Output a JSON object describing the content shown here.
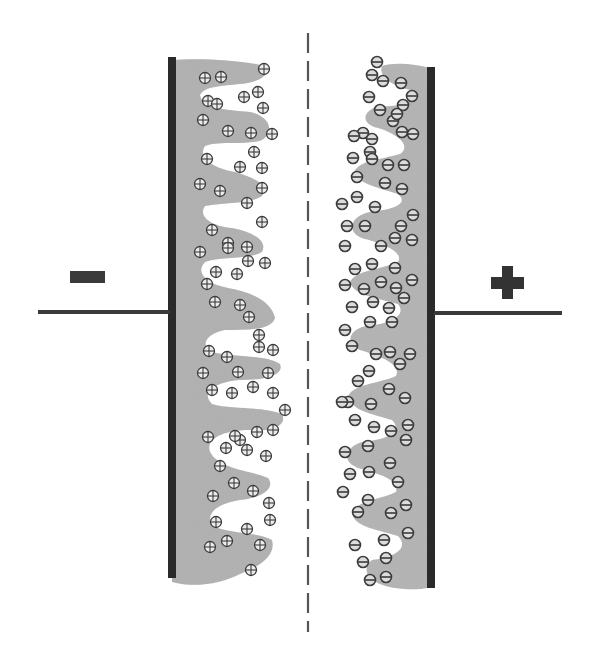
{
  "diagram": {
    "title": "Electric double-layer capacitor",
    "colors": {
      "background": "#ffffff",
      "electrode_plate": "#2a2a2a",
      "porous_material": "#a9a9a9",
      "porous_material_dark": "#8c8c8c",
      "wire": "#3a3a3a",
      "ion_stroke": "#3c3c3c",
      "ion_fill": "#e6e6e6",
      "separator": "#555555"
    },
    "negative_terminal": {
      "symbol": "−",
      "label": "negative-electrode"
    },
    "positive_terminal": {
      "symbol": "+",
      "label": "positive-electrode"
    },
    "separator": {
      "style": "dashed",
      "label": "separator"
    },
    "left_ions": {
      "type": "cation",
      "glyph": "⊕",
      "positions": [
        [
          205,
          78
        ],
        [
          221,
          77
        ],
        [
          264,
          69
        ],
        [
          258,
          92
        ],
        [
          208,
          101
        ],
        [
          217,
          104
        ],
        [
          244,
          97
        ],
        [
          263,
          108
        ],
        [
          203,
          120
        ],
        [
          228,
          131
        ],
        [
          251,
          133
        ],
        [
          272,
          134
        ],
        [
          254,
          152
        ],
        [
          207,
          159
        ],
        [
          240,
          167
        ],
        [
          262,
          168
        ],
        [
          200,
          184
        ],
        [
          220,
          191
        ],
        [
          262,
          188
        ],
        [
          247,
          203
        ],
        [
          262,
          222
        ],
        [
          212,
          230
        ],
        [
          228,
          243
        ],
        [
          247,
          247
        ],
        [
          200,
          252
        ],
        [
          228,
          248
        ],
        [
          248,
          261
        ],
        [
          265,
          263
        ],
        [
          216,
          272
        ],
        [
          237,
          274
        ],
        [
          207,
          284
        ],
        [
          215,
          302
        ],
        [
          240,
          305
        ],
        [
          249,
          317
        ],
        [
          259,
          335
        ],
        [
          209,
          351
        ],
        [
          227,
          357
        ],
        [
          259,
          347
        ],
        [
          273,
          350
        ],
        [
          203,
          373
        ],
        [
          238,
          372
        ],
        [
          268,
          373
        ],
        [
          212,
          390
        ],
        [
          232,
          393
        ],
        [
          253,
          387
        ],
        [
          273,
          393
        ],
        [
          285,
          410
        ],
        [
          273,
          430
        ],
        [
          208,
          437
        ],
        [
          240,
          440
        ],
        [
          257,
          432
        ],
        [
          226,
          448
        ],
        [
          235,
          436
        ],
        [
          247,
          450
        ],
        [
          266,
          456
        ],
        [
          220,
          466
        ],
        [
          213,
          496
        ],
        [
          234,
          483
        ],
        [
          253,
          491
        ],
        [
          269,
          503
        ],
        [
          216,
          522
        ],
        [
          247,
          529
        ],
        [
          227,
          541
        ],
        [
          260,
          545
        ],
        [
          210,
          547
        ],
        [
          251,
          570
        ],
        [
          270,
          520
        ]
      ]
    },
    "right_ions": {
      "type": "anion",
      "glyph": "⊖",
      "positions": [
        [
          377,
          62
        ],
        [
          372,
          75
        ],
        [
          383,
          81
        ],
        [
          401,
          83
        ],
        [
          412,
          96
        ],
        [
          403,
          105
        ],
        [
          369,
          97
        ],
        [
          380,
          110
        ],
        [
          393,
          121
        ],
        [
          397,
          114
        ],
        [
          402,
          132
        ],
        [
          413,
          134
        ],
        [
          363,
          133
        ],
        [
          372,
          139
        ],
        [
          354,
          136
        ],
        [
          370,
          152
        ],
        [
          353,
          158
        ],
        [
          372,
          159
        ],
        [
          388,
          165
        ],
        [
          404,
          165
        ],
        [
          357,
          177
        ],
        [
          385,
          183
        ],
        [
          402,
          189
        ],
        [
          357,
          197
        ],
        [
          375,
          207
        ],
        [
          342,
          204
        ],
        [
          347,
          226
        ],
        [
          365,
          226
        ],
        [
          401,
          226
        ],
        [
          413,
          215
        ],
        [
          381,
          246
        ],
        [
          395,
          238
        ],
        [
          412,
          240
        ],
        [
          345,
          246
        ],
        [
          372,
          264
        ],
        [
          355,
          269
        ],
        [
          395,
          268
        ],
        [
          345,
          285
        ],
        [
          381,
          282
        ],
        [
          364,
          289
        ],
        [
          396,
          288
        ],
        [
          412,
          280
        ],
        [
          352,
          307
        ],
        [
          373,
          302
        ],
        [
          389,
          308
        ],
        [
          404,
          298
        ],
        [
          345,
          330
        ],
        [
          370,
          322
        ],
        [
          392,
          322
        ],
        [
          352,
          346
        ],
        [
          376,
          354
        ],
        [
          390,
          352
        ],
        [
          410,
          354
        ],
        [
          369,
          371
        ],
        [
          400,
          364
        ],
        [
          358,
          381
        ],
        [
          389,
          389
        ],
        [
          348,
          402
        ],
        [
          371,
          404
        ],
        [
          405,
          398
        ],
        [
          342,
          402
        ],
        [
          355,
          420
        ],
        [
          374,
          427
        ],
        [
          391,
          431
        ],
        [
          408,
          425
        ],
        [
          345,
          452
        ],
        [
          368,
          446
        ],
        [
          406,
          440
        ],
        [
          369,
          472
        ],
        [
          350,
          474
        ],
        [
          390,
          463
        ],
        [
          398,
          482
        ],
        [
          343,
          492
        ],
        [
          368,
          500
        ],
        [
          358,
          512
        ],
        [
          391,
          513
        ],
        [
          406,
          505
        ],
        [
          384,
          540
        ],
        [
          408,
          533
        ],
        [
          386,
          558
        ],
        [
          363,
          562
        ],
        [
          355,
          545
        ],
        [
          370,
          580
        ],
        [
          386,
          577
        ]
      ]
    }
  }
}
